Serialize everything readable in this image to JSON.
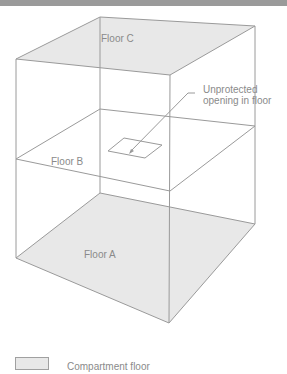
{
  "figure": {
    "colors": {
      "top_bar": "#9a9a9a",
      "compartment_fill": "#e8e8e8",
      "line": "#9a9a9a",
      "text": "#8a8a8a"
    },
    "floors": [
      {
        "id": "floor-c",
        "label": "Floor C",
        "filled": true
      },
      {
        "id": "floor-b",
        "label": "Floor B",
        "filled": false
      },
      {
        "id": "floor-a",
        "label": "Floor A",
        "filled": true
      }
    ],
    "annotation": {
      "line1": "Unprotected",
      "line2": "opening in floor"
    },
    "legend": {
      "label": "Compartment floor"
    }
  }
}
